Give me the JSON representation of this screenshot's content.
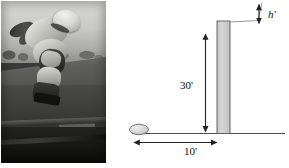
{
  "figure": {
    "panels": [
      "photo",
      "diagram"
    ]
  },
  "photo": {
    "alt": "Black and white photograph of an inline skater inverted in mid-air above a skate ramp",
    "subject": "inline-skater",
    "palette": {
      "sky": "#d0d0cd",
      "ramp": "#4e4e4a",
      "floor": "#141412"
    }
  },
  "diagram": {
    "type": "physics-schematic",
    "wall": {
      "label": "vertical wall",
      "height_label": "30'",
      "fill": "#cccccc",
      "stroke": "#555555"
    },
    "ball": {
      "label": "ball",
      "fill": "#d9d9d9",
      "stroke": "#666666"
    },
    "ground": {
      "label": "ground line",
      "stroke": "#444444"
    },
    "dimensions": [
      {
        "name": "wall-height",
        "value": "30'",
        "orientation": "vertical"
      },
      {
        "name": "ball-distance",
        "value": "10'",
        "orientation": "horizontal"
      },
      {
        "name": "extra-height",
        "value": "h'",
        "orientation": "vertical"
      }
    ],
    "sight_line": {
      "label": "trajectory line",
      "stroke": "#777777"
    },
    "colors": {
      "ink": "#111111",
      "line": "#444444",
      "wall_fill": "#cccccc",
      "background": "#ffffff"
    }
  }
}
